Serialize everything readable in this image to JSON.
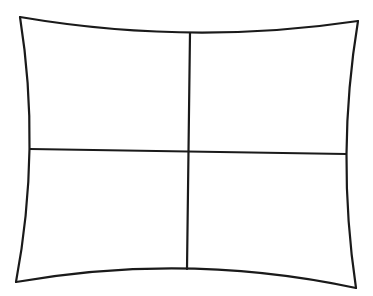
{
  "diagram": {
    "type": "pincushion-grid",
    "stroke_color": "#1a1a1a",
    "background": "#ffffff",
    "rows": 2,
    "columns": 2,
    "corners": {
      "top_left": [
        20,
        17
      ],
      "top_right": [
        358,
        21
      ],
      "bottom_right": [
        356,
        288
      ],
      "bottom_left": [
        16,
        282
      ]
    }
  }
}
